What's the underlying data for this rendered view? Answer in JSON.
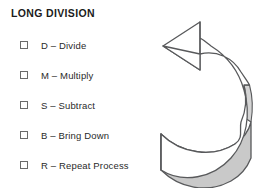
{
  "header": {
    "title": "LONG DIVISION"
  },
  "checklist": {
    "items": [
      {
        "checkbox": "empty-checkbox",
        "label": "D – Divide"
      },
      {
        "checkbox": "empty-checkbox",
        "label": "M – Multiply"
      },
      {
        "checkbox": "empty-checkbox",
        "label": "S – Subtract"
      },
      {
        "checkbox": "empty-checkbox",
        "label": "B – Bring Down"
      },
      {
        "checkbox": "empty-checkbox",
        "label": "R – Repeat Process"
      }
    ]
  },
  "graphic": {
    "name": "curved-repeat-arrow",
    "description": "Curved 3D band arrow sweeping from lower left around the right side and back to an arrowhead pointing upper left",
    "colors": {
      "outline": "#58595b",
      "top_face": "#ffffff",
      "band_shade": "#c9c9c9",
      "edge_shade": "#d9d9d9"
    }
  },
  "page": {
    "background": "#ffffff",
    "text_color": "#231f20"
  }
}
